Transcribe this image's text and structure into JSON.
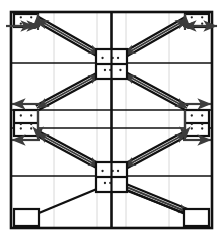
{
  "figure": {
    "kind": "braced-frame-elevation-diagram",
    "title": "",
    "background_color": "#ffffff",
    "ink_color": "#111111",
    "gridline_color": "#d8d8d8",
    "arrow_color": "#3c3c3c",
    "frame": {
      "x": 11,
      "y": 12,
      "width": 201,
      "height": 216,
      "border_width": 2.6
    },
    "grid": {
      "show_faint_vertical": true,
      "faint_vertical_x": [
        54,
        97,
        126,
        169
      ],
      "bay_divider_x": [
        111.5
      ],
      "story_line_y": [
        63,
        110,
        128,
        176
      ],
      "story_line_width": 1.6,
      "bay_divider_width": 2.6
    },
    "gusset_plates": [
      {
        "name": "top-left-gusset",
        "x": 14,
        "y": 14,
        "width": 24,
        "height": 13,
        "dots": 4,
        "split": "none"
      },
      {
        "name": "top-right-gusset",
        "x": 185,
        "y": 14,
        "width": 24,
        "height": 13,
        "dots": 4,
        "split": "none"
      },
      {
        "name": "center-upper-gusset",
        "x": 96,
        "y": 49,
        "width": 31,
        "height": 30,
        "dots": 6,
        "split": "cross"
      },
      {
        "name": "mid-left-gusset",
        "x": 14,
        "y": 110,
        "width": 24,
        "height": 26,
        "dots": 6,
        "split": "horizontal"
      },
      {
        "name": "mid-right-gusset",
        "x": 185,
        "y": 110,
        "width": 24,
        "height": 26,
        "dots": 6,
        "split": "horizontal"
      },
      {
        "name": "center-lower-gusset",
        "x": 96,
        "y": 162,
        "width": 31,
        "height": 30,
        "dots": 5,
        "split": "cross"
      },
      {
        "name": "base-left-plate",
        "x": 14,
        "y": 209,
        "width": 25,
        "height": 17,
        "dots": 0,
        "split": "none"
      },
      {
        "name": "base-right-plate",
        "x": 184,
        "y": 209,
        "width": 25,
        "height": 17,
        "dots": 0,
        "split": "none"
      }
    ],
    "braces": [
      {
        "name": "brace-upper-left",
        "x1": 37,
        "y1": 19,
        "x2": 100,
        "y2": 55,
        "double": true,
        "arrow": "both"
      },
      {
        "name": "brace-upper-right",
        "x1": 187,
        "y1": 19,
        "x2": 124,
        "y2": 55,
        "double": true,
        "arrow": "both"
      },
      {
        "name": "brace-mid-left",
        "x1": 100,
        "y1": 74,
        "x2": 37,
        "y2": 108,
        "double": true,
        "arrow": "both"
      },
      {
        "name": "brace-mid-right",
        "x1": 124,
        "y1": 74,
        "x2": 187,
        "y2": 108,
        "double": true,
        "arrow": "both"
      },
      {
        "name": "brace-lower-left",
        "x1": 37,
        "y1": 133,
        "x2": 100,
        "y2": 167,
        "double": true,
        "arrow": "both"
      },
      {
        "name": "brace-lower-right",
        "x1": 187,
        "y1": 133,
        "x2": 124,
        "y2": 167,
        "double": true,
        "arrow": "both"
      },
      {
        "name": "brace-base-right",
        "x1": 124,
        "y1": 186,
        "x2": 190,
        "y2": 213,
        "double": true,
        "arrow": "end"
      },
      {
        "name": "strut-base-left",
        "x1": 104,
        "y1": 186,
        "x2": 39,
        "y2": 213,
        "double": false,
        "arrow": "none"
      },
      {
        "name": "strut-base-right",
        "x1": 115,
        "y1": 186,
        "x2": 184,
        "y2": 213,
        "double": false,
        "arrow": "none"
      }
    ],
    "load_arrows": [
      {
        "name": "load-top-left-out",
        "x1": 34,
        "y1": 26,
        "x2": 6,
        "y2": 26,
        "head": "start",
        "dot": true
      },
      {
        "name": "load-top-left-in",
        "x1": 12,
        "y1": 26,
        "x2": 40,
        "y2": 26,
        "head": "end",
        "dot": false
      },
      {
        "name": "load-top-right-out",
        "x1": 189,
        "y1": 26,
        "x2": 217,
        "y2": 26,
        "head": "end",
        "dot": true
      },
      {
        "name": "load-top-right-in",
        "x1": 211,
        "y1": 26,
        "x2": 183,
        "y2": 26,
        "head": "end",
        "dot": false
      },
      {
        "name": "load-mid-left-upper",
        "x1": 40,
        "y1": 104,
        "x2": 12,
        "y2": 104,
        "head": "end",
        "dot": false
      },
      {
        "name": "load-mid-left-lower",
        "x1": 40,
        "y1": 140,
        "x2": 12,
        "y2": 140,
        "head": "end",
        "dot": false
      },
      {
        "name": "load-mid-right-upper",
        "x1": 183,
        "y1": 104,
        "x2": 211,
        "y2": 104,
        "head": "end",
        "dot": false
      },
      {
        "name": "load-mid-right-lower",
        "x1": 183,
        "y1": 140,
        "x2": 211,
        "y2": 140,
        "head": "end",
        "dot": false
      },
      {
        "name": "column-tie-top-left",
        "x1": 38,
        "y1": 14,
        "x2": 38,
        "y2": 30,
        "head": "start",
        "dot": false
      },
      {
        "name": "column-tie-top-right",
        "x1": 185,
        "y1": 14,
        "x2": 185,
        "y2": 30,
        "head": "start",
        "dot": false
      },
      {
        "name": "column-tie-mid-left",
        "x1": 38,
        "y1": 110,
        "x2": 38,
        "y2": 140,
        "head": "end",
        "dot": false
      },
      {
        "name": "column-tie-mid-right",
        "x1": 185,
        "y1": 110,
        "x2": 185,
        "y2": 140,
        "head": "end",
        "dot": false
      }
    ]
  }
}
